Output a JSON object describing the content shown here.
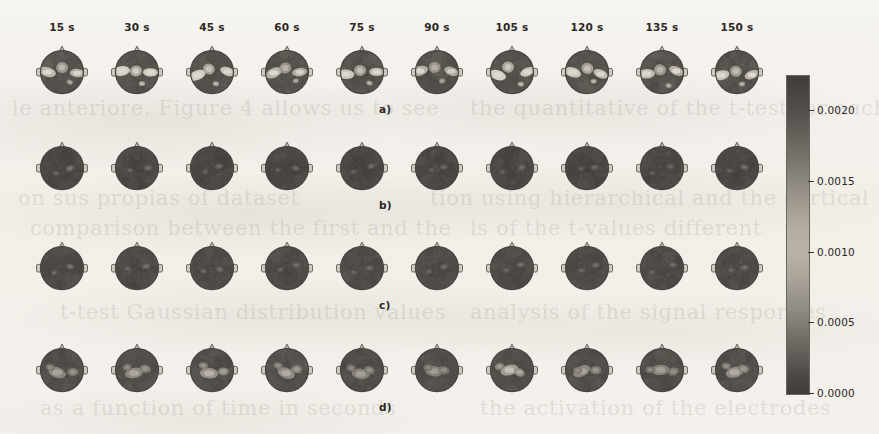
{
  "figure": {
    "title": "",
    "background_color": "#f4f2ee",
    "colormap": "grayscale"
  },
  "ghost_text": [
    {
      "text": "le anteriore. Figure 4 allows us to see",
      "x": 12,
      "y": 96
    },
    {
      "text": "the quantitative of the t-test for each",
      "x": 470,
      "y": 96
    },
    {
      "text": "on sus propias of dataset",
      "x": 18,
      "y": 186
    },
    {
      "text": "tion using hierarchical and the cortical",
      "x": 430,
      "y": 186
    },
    {
      "text": "comparison between the first and the",
      "x": 30,
      "y": 216
    },
    {
      "text": "ls of the t-values different",
      "x": 470,
      "y": 216
    },
    {
      "text": "t-test Gaussian distribution values",
      "x": 60,
      "y": 300
    },
    {
      "text": "analysis of the signal responses",
      "x": 470,
      "y": 300
    },
    {
      "text": "as a function of time in seconds",
      "x": 40,
      "y": 396
    },
    {
      "text": "the activation of the electrodes",
      "x": 480,
      "y": 396
    }
  ],
  "chart_data": {
    "type": "heatmap",
    "title": "",
    "xlabel": "",
    "ylabel": "",
    "grid": false,
    "legend_position": "right",
    "colorbar": {
      "label": "",
      "orientation": "vertical",
      "vmin": 0.0,
      "vmax": 0.00225,
      "ticks": [
        0.0,
        0.0005,
        0.001,
        0.0015,
        0.002
      ],
      "tick_labels": [
        "0.0000",
        "0.0005",
        "0.0010",
        "0.0015",
        "0.0020"
      ]
    },
    "columns": [
      "15 s",
      "30 s",
      "45 s",
      "60 s",
      "75 s",
      "90 s",
      "105 s",
      "120 s",
      "135 s",
      "150 s"
    ],
    "column_values": [
      15,
      30,
      45,
      60,
      75,
      90,
      105,
      120,
      135,
      150
    ],
    "column_unit": "s",
    "rows": [
      {
        "label": "a)",
        "panel": "a",
        "peak_values": [
          0.0017,
          0.00205,
          0.00195,
          0.00165,
          0.00185,
          0.0016,
          0.002,
          0.0019,
          0.00175,
          0.0018
        ]
      },
      {
        "label": "b)",
        "panel": "b",
        "peak_values": [
          0.00075,
          0.0006,
          0.00055,
          0.0005,
          0.0005,
          0.00045,
          0.00055,
          0.0005,
          0.00045,
          0.0006
        ]
      },
      {
        "label": "c)",
        "panel": "c",
        "peak_values": [
          0.00055,
          0.0005,
          0.00048,
          0.00045,
          0.00045,
          0.00042,
          0.0005,
          0.00048,
          0.00044,
          0.0005
        ]
      },
      {
        "label": "d)",
        "panel": "d",
        "peak_values": [
          0.0011,
          0.00115,
          0.0013,
          0.0012,
          0.00105,
          0.001,
          0.00145,
          0.00115,
          0.00105,
          0.0012
        ]
      }
    ],
    "topomaps": "EEG scalp topographic maps: circular head outline with nose marker at top and ear markers at left and right"
  },
  "layout": {
    "columns_count": 10,
    "rows_count": 4,
    "first_column_center_x": 62,
    "column_step_x": 75,
    "row_centers_y": [
      72,
      168,
      268,
      370
    ],
    "topomap_size": 52,
    "colorbar_x": 786,
    "colorbar_y": 75,
    "colorbar_width": 22,
    "colorbar_height": 318
  },
  "icons": {
    "head_outline": "head-outline-icon",
    "nose_marker": "nose-marker-icon",
    "ear_marker": "ear-marker-icon"
  }
}
